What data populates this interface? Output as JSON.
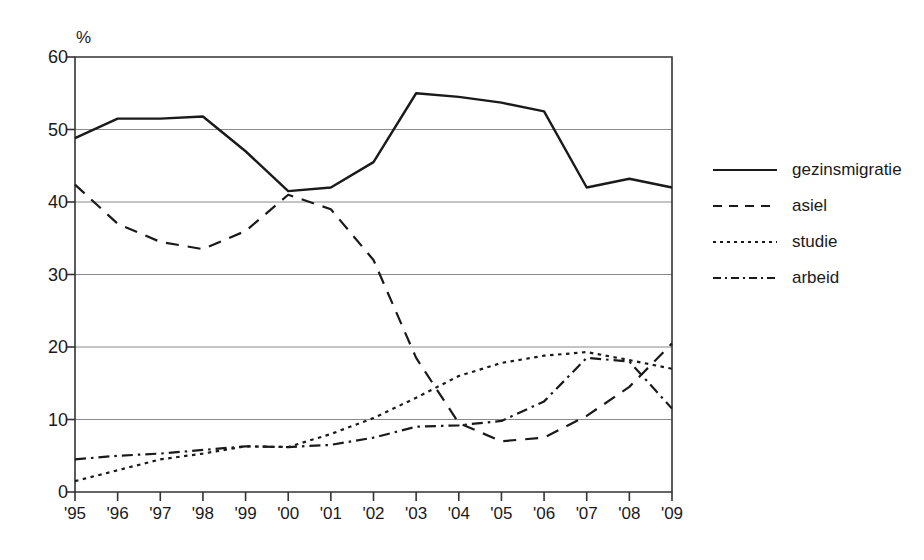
{
  "chart_data": {
    "type": "line",
    "title": "",
    "subtitle": "",
    "xlabel": "",
    "ylabel": "%",
    "unit_label": "%",
    "x": [
      "'95",
      "'96",
      "'97",
      "'98",
      "'99",
      "'00",
      "'01",
      "'02",
      "'03",
      "'04",
      "'05",
      "'06",
      "'07",
      "'08",
      "'09"
    ],
    "categories": [
      "'95",
      "'96",
      "'97",
      "'98",
      "'99",
      "'00",
      "'01",
      "'02",
      "'03",
      "'04",
      "'05",
      "'06",
      "'07",
      "'08",
      "'09"
    ],
    "xlim": [
      0,
      14
    ],
    "ylim": [
      0,
      60
    ],
    "yticks": [
      0,
      10,
      20,
      30,
      40,
      50,
      60
    ],
    "xticks": [
      "'95",
      "'96",
      "'97",
      "'98",
      "'99",
      "'00",
      "'01",
      "'02",
      "'03",
      "'04",
      "'05",
      "'06",
      "'07",
      "'08",
      "'09"
    ],
    "grid": "horizontal",
    "legend_position": "right",
    "series": [
      {
        "name": "gezinsmigratie",
        "style": "solid",
        "color": "#1a1a1a",
        "values": [
          48.8,
          51.5,
          51.5,
          51.8,
          47.0,
          41.5,
          42.0,
          45.5,
          55.0,
          54.5,
          53.7,
          52.5,
          42.0,
          43.2,
          42.0
        ]
      },
      {
        "name": "asiel",
        "style": "dashed",
        "color": "#1a1a1a",
        "values": [
          42.4,
          37.0,
          34.5,
          33.5,
          36.0,
          41.0,
          39.0,
          32.0,
          18.5,
          9.5,
          7.0,
          7.5,
          10.5,
          14.5,
          20.5
        ]
      },
      {
        "name": "studie",
        "style": "dotted",
        "color": "#1a1a1a",
        "values": [
          1.5,
          3.0,
          4.5,
          5.3,
          6.3,
          6.2,
          8.0,
          10.2,
          13.0,
          16.0,
          17.8,
          18.8,
          19.3,
          18.2,
          17.0
        ]
      },
      {
        "name": "arbeid",
        "style": "dashdot",
        "color": "#1a1a1a",
        "values": [
          4.5,
          5.0,
          5.3,
          5.8,
          6.3,
          6.2,
          6.5,
          7.5,
          9.0,
          9.2,
          9.8,
          12.5,
          18.5,
          18.0,
          11.5
        ]
      }
    ]
  },
  "legend": {
    "entries": [
      {
        "label": "gezinsmigratie",
        "style": "solid"
      },
      {
        "label": "asiel",
        "style": "dashed"
      },
      {
        "label": "studie",
        "style": "dotted"
      },
      {
        "label": "arbeid",
        "style": "dashdot"
      }
    ]
  }
}
